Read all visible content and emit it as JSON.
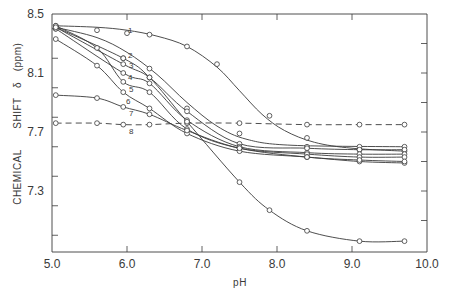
{
  "chart_data": {
    "type": "scatter",
    "title": "",
    "xlabel": "pH",
    "ylabel": "CHEMICAL SHIFT δ (ppm)",
    "xlim": [
      5.0,
      10.0
    ],
    "ylim": [
      6.9,
      8.5
    ],
    "xticks": [
      "5.0",
      "6.0",
      "7.0",
      "8.0",
      "9.0",
      "10.0"
    ],
    "yticks": [
      "8.5",
      "8.1",
      "7.7",
      "7.3"
    ],
    "grid": false,
    "legend": "inline curve numbers 1-8",
    "series": [
      {
        "name": "1",
        "style": "solid",
        "x": [
          5.05,
          5.6,
          6.0,
          6.3,
          6.8,
          7.2,
          7.9,
          8.4,
          9.1,
          9.7
        ],
        "y": [
          8.42,
          8.39,
          8.37,
          8.36,
          8.28,
          8.16,
          7.81,
          7.66,
          7.58,
          7.57
        ],
        "fit": [
          [
            5.05,
            8.42
          ],
          [
            5.6,
            8.41
          ],
          [
            6.0,
            8.39
          ],
          [
            6.4,
            8.35
          ],
          [
            6.8,
            8.28
          ],
          [
            7.2,
            8.14
          ],
          [
            7.5,
            7.98
          ],
          [
            7.8,
            7.82
          ],
          [
            8.1,
            7.71
          ],
          [
            8.5,
            7.63
          ],
          [
            9.0,
            7.59
          ],
          [
            9.7,
            7.57
          ]
        ]
      },
      {
        "name": "2",
        "style": "solid",
        "x": [
          5.05,
          5.95,
          6.3,
          6.8,
          7.5,
          8.4,
          9.1,
          9.7
        ],
        "y": [
          8.4,
          8.2,
          8.13,
          7.86,
          7.69,
          7.6,
          7.6,
          7.6
        ],
        "fit": [
          [
            5.05,
            8.41
          ],
          [
            5.6,
            8.34
          ],
          [
            6.0,
            8.24
          ],
          [
            6.4,
            8.09
          ],
          [
            6.8,
            7.9
          ],
          [
            7.2,
            7.74
          ],
          [
            7.6,
            7.65
          ],
          [
            8.2,
            7.61
          ],
          [
            9.7,
            7.6
          ]
        ]
      },
      {
        "name": "3",
        "style": "solid",
        "x": [
          5.05,
          5.95,
          6.3,
          6.8,
          7.5,
          8.4,
          9.1,
          9.7
        ],
        "y": [
          8.41,
          8.16,
          8.07,
          7.84,
          7.62,
          7.59,
          7.58,
          7.58
        ]
      },
      {
        "name": "4",
        "style": "solid",
        "x": [
          5.05,
          5.95,
          6.3,
          6.8,
          7.5,
          8.4,
          9.1,
          9.7
        ],
        "y": [
          8.4,
          8.1,
          8.03,
          7.78,
          7.6,
          7.56,
          7.55,
          7.55
        ]
      },
      {
        "name": "5",
        "style": "solid",
        "x": [
          5.05,
          5.6,
          5.95,
          6.3,
          6.8,
          7.5,
          8.4,
          9.1,
          9.7
        ],
        "y": [
          8.42,
          8.27,
          8.04,
          7.97,
          7.72,
          7.59,
          7.55,
          7.53,
          7.53
        ]
      },
      {
        "name": "6",
        "style": "solid",
        "x": [
          5.05,
          5.6,
          5.95,
          6.3,
          6.8,
          7.5,
          8.4,
          9.1,
          9.7
        ],
        "y": [
          8.33,
          8.15,
          7.97,
          7.86,
          7.69,
          7.57,
          7.53,
          7.5,
          7.49
        ]
      },
      {
        "name": "7",
        "style": "solid",
        "x": [
          5.05,
          5.6,
          5.95,
          6.3,
          6.8,
          7.5,
          8.4,
          9.1,
          9.7
        ],
        "y": [
          7.95,
          7.93,
          7.87,
          7.82,
          7.71,
          7.59,
          7.53,
          7.51,
          7.5
        ]
      },
      {
        "name": "8",
        "style": "dashed",
        "x": [
          5.05,
          5.6,
          5.95,
          6.3,
          6.8,
          7.5,
          8.4,
          9.1,
          9.7
        ],
        "y": [
          7.76,
          7.76,
          7.75,
          7.75,
          7.76,
          7.76,
          7.75,
          7.75,
          7.75
        ]
      },
      {
        "name": "9",
        "style": "solid",
        "x": [
          5.05,
          5.95,
          6.3,
          6.8,
          7.5,
          7.9,
          8.4,
          9.1,
          9.7
        ],
        "y": [
          8.41,
          8.2,
          8.07,
          7.77,
          7.36,
          7.17,
          7.03,
          6.96,
          6.96
        ]
      }
    ]
  },
  "axes": {
    "x_title": "pH",
    "y_title_left": "CHEMICAL",
    "y_title_mid": "SHIFT",
    "y_title_symbol": "δ",
    "y_title_unit": "(ppm)",
    "x_tick_labels": [
      "5.0",
      "6.0",
      "7.0",
      "8.0",
      "9.0",
      "10.0"
    ],
    "y_tick_labels": [
      "8.5",
      "8.1",
      "7.7",
      "7.3"
    ]
  },
  "curve_labels": [
    "1",
    "2",
    "3",
    "4",
    "5",
    "6",
    "7",
    "8"
  ]
}
